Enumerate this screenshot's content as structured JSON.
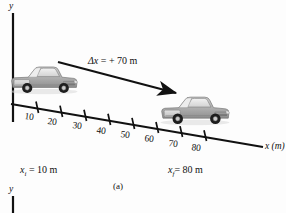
{
  "figure": {
    "panel_label": "(a)",
    "background_color": "#fdfdfd",
    "ink_color": "#111111"
  },
  "axes": {
    "y_axis_top": {
      "name": "y"
    },
    "y_axis_bottom": {
      "name": "y"
    },
    "x_axis": {
      "name": "x",
      "unit": "(m)",
      "tick_values": [
        "10",
        "20",
        "30",
        "40",
        "50",
        "60",
        "70",
        "80"
      ]
    }
  },
  "annotations": {
    "displacement": {
      "symbol": "Δx",
      "equals": "=",
      "value": "+ 70 m",
      "full_text": "Δx = + 70 m"
    },
    "initial_position": {
      "symbol": "x",
      "subscript": "i",
      "equals": "=",
      "value": "10 m",
      "full_text": "x_i = 10 m"
    },
    "final_position": {
      "symbol": "x",
      "subscript": "f",
      "equals": "=",
      "value": "80 m",
      "full_text": "x_f = 80 m"
    }
  },
  "objects": [
    {
      "name": "truck-initial",
      "label": "pickup truck at initial position",
      "position_m": "10"
    },
    {
      "name": "truck-final",
      "label": "pickup truck at final position",
      "position_m": "80"
    }
  ]
}
